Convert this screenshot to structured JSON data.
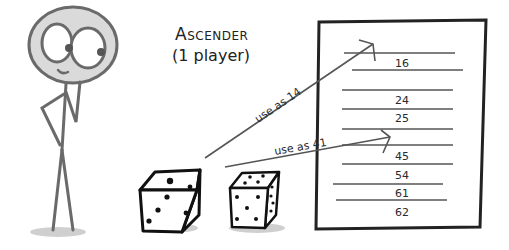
{
  "title": "Ascender",
  "subtitle": "(1 player)",
  "arrows": [
    {
      "label": "use as 14",
      "target_slot": 1
    },
    {
      "label": "use as 41",
      "target_slot": 5
    }
  ],
  "sheet": {
    "entries": [
      "16",
      "",
      "24",
      "25",
      "",
      "45",
      "54",
      "61",
      "62"
    ]
  },
  "dice": [
    {
      "name": "die-1",
      "top_face": 1,
      "front_face": 3
    },
    {
      "name": "die-2",
      "top_face": 4,
      "front_face": 5
    }
  ],
  "colors": {
    "ink": "#222222",
    "line": "#555555",
    "head_fill": "#d9d9d9",
    "figure": "#6a6a6a"
  }
}
